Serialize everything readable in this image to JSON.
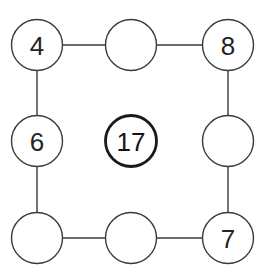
{
  "figure": {
    "type": "circle-ring-puzzle",
    "width": 267,
    "height": 274,
    "background_color": "#ffffff",
    "stroke_color": "#3a3a3a",
    "emphasis_stroke_color": "#1a1a1a",
    "text_color": "#242424"
  },
  "nodes": [
    {
      "id": "top-left",
      "label": "4",
      "cx": 37,
      "cy": 45,
      "r": 25.5,
      "emphasis": false,
      "filled": false
    },
    {
      "id": "top-middle",
      "label": "",
      "cx": 131,
      "cy": 45,
      "r": 25.5,
      "emphasis": false,
      "filled": false
    },
    {
      "id": "top-right",
      "label": "8",
      "cx": 228,
      "cy": 45,
      "r": 25.5,
      "emphasis": false,
      "filled": false
    },
    {
      "id": "middle-left",
      "label": "6",
      "cx": 37,
      "cy": 141,
      "r": 25.5,
      "emphasis": false,
      "filled": false
    },
    {
      "id": "center",
      "label": "17",
      "cx": 131,
      "cy": 141,
      "r": 25.5,
      "emphasis": true,
      "filled": false
    },
    {
      "id": "middle-right",
      "label": "",
      "cx": 228,
      "cy": 141,
      "r": 25.5,
      "emphasis": false,
      "filled": false
    },
    {
      "id": "bottom-left",
      "label": "",
      "cx": 37,
      "cy": 238,
      "r": 25.5,
      "emphasis": false,
      "filled": false
    },
    {
      "id": "bottom-middle",
      "label": "",
      "cx": 131,
      "cy": 238,
      "r": 25.5,
      "emphasis": false,
      "filled": false
    },
    {
      "id": "bottom-right",
      "label": "7",
      "cx": 228,
      "cy": 238,
      "r": 25.5,
      "emphasis": false,
      "filled": false
    }
  ],
  "edges": [
    {
      "id": "edge-top-left-to-top-middle",
      "x1": 62.5,
      "y1": 45,
      "x2": 105.5,
      "y2": 45
    },
    {
      "id": "edge-top-middle-to-top-right",
      "x1": 156.5,
      "y1": 45,
      "x2": 202.5,
      "y2": 45
    },
    {
      "id": "edge-top-left-to-middle-left",
      "x1": 37,
      "y1": 70.5,
      "x2": 37,
      "y2": 115.5
    },
    {
      "id": "edge-middle-left-to-bottom-left",
      "x1": 37,
      "y1": 166.5,
      "x2": 37,
      "y2": 212.5
    },
    {
      "id": "edge-top-right-to-middle-right",
      "x1": 228,
      "y1": 70.5,
      "x2": 228,
      "y2": 115.5
    },
    {
      "id": "edge-middle-right-to-bottom-right",
      "x1": 228,
      "y1": 166.5,
      "x2": 228,
      "y2": 212.5
    },
    {
      "id": "edge-bottom-left-to-bottom-middle",
      "x1": 62.5,
      "y1": 238,
      "x2": 105.5,
      "y2": 238
    },
    {
      "id": "edge-bottom-middle-to-bottom-right",
      "x1": 156.5,
      "y1": 238,
      "x2": 202.5,
      "y2": 238
    }
  ],
  "chart_data": {
    "type": "diagram",
    "title": "",
    "subtitle": "",
    "categories": [
      "top-left",
      "top-middle",
      "top-right",
      "middle-left",
      "center",
      "middle-right",
      "bottom-left",
      "bottom-middle",
      "bottom-right"
    ],
    "values": [
      "4",
      "",
      "8",
      "6",
      "17",
      "",
      "",
      "",
      "7"
    ],
    "filled_values": [
      "4",
      "8",
      "6",
      "17",
      "7"
    ],
    "empty_positions": [
      "top-middle",
      "middle-right",
      "bottom-left",
      "bottom-middle"
    ],
    "emphasised_node": "center",
    "emphasised_value": "17",
    "legend": [],
    "annotations": [],
    "grid": false
  }
}
